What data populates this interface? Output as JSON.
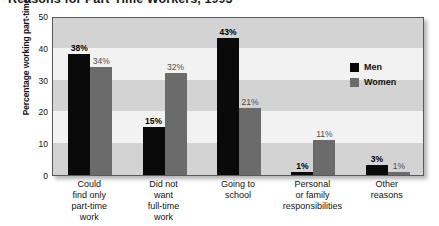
{
  "chart_data": {
    "type": "bar",
    "title": "Reasons for Part-Time Workers, 1995",
    "xlabel": "",
    "ylabel": "Percentage working part-time",
    "ylim": [
      0,
      50
    ],
    "yticks": [
      "0",
      "10",
      "20",
      "30",
      "40",
      "50"
    ],
    "grid": "alternating horizontal bands",
    "legend_position": "inside upper right",
    "categories": [
      [
        "Could",
        "find only",
        "part-time",
        "work"
      ],
      [
        "Did not",
        "want",
        "full-time",
        "work"
      ],
      [
        "Going to",
        "school"
      ],
      [
        "Personal",
        "or family",
        "responsibilities"
      ],
      [
        "Other",
        "reasons"
      ]
    ],
    "series": [
      {
        "name": "Men",
        "color": "#0a0a0a",
        "values": [
          38,
          15,
          43,
          1,
          3
        ],
        "labels": [
          "38%",
          "15%",
          "43%",
          "1%",
          "3%"
        ]
      },
      {
        "name": "Women",
        "color": "#6b6b6b",
        "values": [
          34,
          32,
          21,
          11,
          1
        ],
        "labels": [
          "34%",
          "32%",
          "21%",
          "11%",
          "1%"
        ]
      }
    ],
    "bands": [
      {
        "from": 0,
        "to": 10,
        "shade": "dark"
      },
      {
        "from": 10,
        "to": 20,
        "shade": "light"
      },
      {
        "from": 20,
        "to": 30,
        "shade": "dark"
      },
      {
        "from": 30,
        "to": 40,
        "shade": "light"
      },
      {
        "from": 40,
        "to": 50,
        "shade": "dark"
      }
    ]
  }
}
